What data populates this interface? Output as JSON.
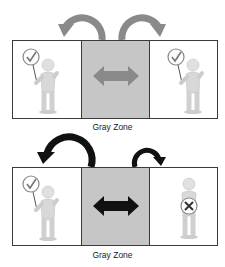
{
  "diagrams": [
    {
      "name": "both-approve",
      "zone_label": "Gray Zone",
      "left_person": {
        "sign": "check"
      },
      "right_person": {
        "sign": "check"
      },
      "arrow_color": "#8a8a8a",
      "left_arc": "large",
      "right_arc": "large"
    },
    {
      "name": "one-rejects",
      "zone_label": "Gray Zone",
      "left_person": {
        "sign": "check"
      },
      "right_person": {
        "sign": "cross"
      },
      "arrow_color": "#111111",
      "left_arc": "large",
      "right_arc": "small"
    }
  ],
  "colors": {
    "zone_fill": "#c6c6c6",
    "border": "#3a3a3a",
    "figure": "#d8d8d8"
  }
}
